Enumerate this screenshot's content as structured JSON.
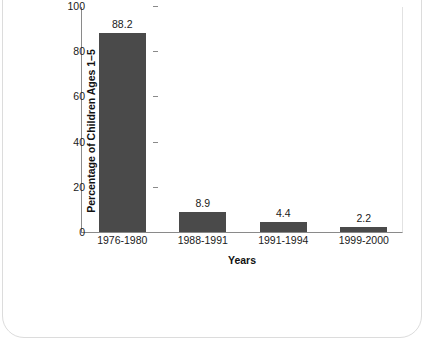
{
  "chart_data": {
    "type": "bar",
    "title": "Children in U.S. With Elevated Blood Lead Levels",
    "xlabel": "Years",
    "ylabel": "Percentage of Children Ages 1–5",
    "categories": [
      "1976-1980",
      "1988-1991",
      "1991-1994",
      "1999-2000"
    ],
    "values": [
      88.2,
      8.9,
      4.4,
      2.2
    ],
    "value_labels": [
      "88.2",
      "8.9",
      "4.4",
      "2.2"
    ],
    "ylim": [
      0,
      100
    ],
    "yticks": [
      0,
      20,
      40,
      60,
      80,
      100
    ],
    "ytick_labels": [
      "0",
      "20",
      "40",
      "60",
      "80",
      "100"
    ],
    "grid": false,
    "legend": false,
    "bar_color": "#4a4a4a",
    "title_band_color": "#d9d9d9",
    "axis_color": "#8a8a8a",
    "text_color": "#1a1a1a"
  }
}
